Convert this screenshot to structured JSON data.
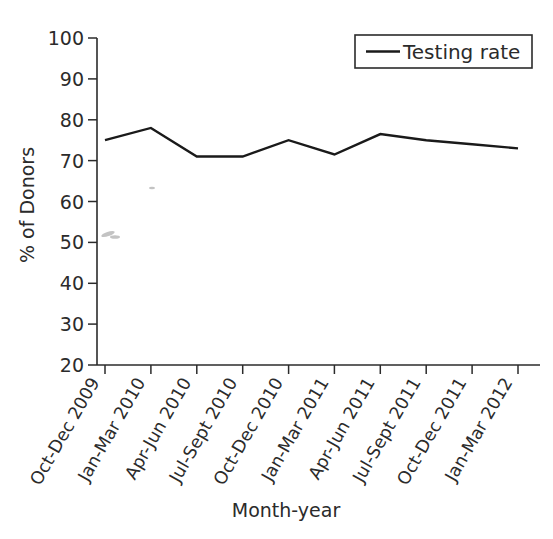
{
  "chart_data": {
    "type": "line",
    "title": "",
    "xlabel": "Month-year",
    "ylabel": "% of Donors",
    "categories": [
      "Oct-Dec 2009",
      "Jan-Mar 2010",
      "Apr-Jun 2010",
      "Jul-Sept 2010",
      "Oct-Dec 2010",
      "Jan-Mar 2011",
      "Apr-Jun 2011",
      "Jul-Sept 2011",
      "Oct-Dec 2011",
      "Jan-Mar 2012"
    ],
    "series": [
      {
        "name": "Testing rate",
        "color": "#1a1a1a",
        "values": [
          75,
          78,
          71,
          71,
          75,
          71.5,
          76.5,
          75,
          74,
          73
        ]
      }
    ],
    "ylim": [
      20,
      100
    ],
    "yticks": [
      20,
      30,
      40,
      50,
      60,
      70,
      80,
      90,
      100
    ],
    "ytick_labels": [
      "20",
      "30",
      "40",
      "50",
      "60",
      "70",
      "80",
      "90",
      "100"
    ],
    "grid": false,
    "legend_position": "top-right",
    "legend_entries": [
      "Testing rate"
    ]
  },
  "legend": {
    "items": [
      {
        "label": "Testing rate"
      }
    ]
  },
  "axes": {
    "x_title": "Month-year",
    "y_title": "% of Donors"
  }
}
